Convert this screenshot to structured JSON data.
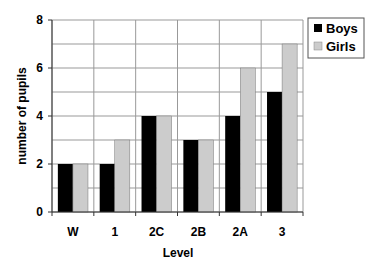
{
  "chart_data": {
    "type": "bar",
    "title": "",
    "xlabel": "Level",
    "ylabel": "number of pupils",
    "categories": [
      "W",
      "1",
      "2C",
      "2B",
      "2A",
      "3"
    ],
    "series": [
      {
        "name": "Boys",
        "color": "#000000",
        "values": [
          2,
          2,
          4,
          3,
          4,
          5
        ]
      },
      {
        "name": "Girls",
        "color": "#cccccc",
        "values": [
          2,
          3,
          4,
          3,
          6,
          7
        ]
      }
    ],
    "ylim": [
      0,
      8
    ],
    "yticks": [
      0,
      2,
      4,
      6,
      8
    ],
    "grid": true,
    "grid_step": 1,
    "legend_position": "right-top"
  }
}
